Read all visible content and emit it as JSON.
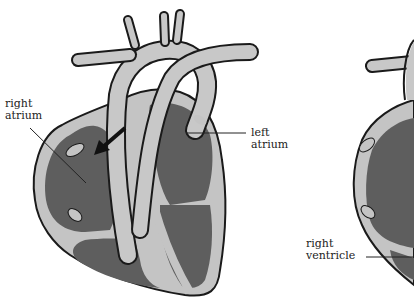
{
  "diagram": {
    "colors": {
      "chamber": "#5e5e5e",
      "wall": "#c4c4c4",
      "outline": "#1a1a1a",
      "vessel": "#c8c8c8",
      "arrow": "#111111",
      "label_text": "#222222",
      "background": "#ffffff"
    },
    "left_heart": {
      "labels": [
        {
          "id": "right-atrium",
          "line1": "right",
          "line2": "atrium"
        },
        {
          "id": "left-atrium",
          "line1": "left",
          "line2": "atrium"
        }
      ],
      "arrow": "blood-flow-arrow"
    },
    "right_heart": {
      "labels": [
        {
          "id": "right-ventricle",
          "line1": "right",
          "line2": "ventricle"
        }
      ]
    }
  }
}
